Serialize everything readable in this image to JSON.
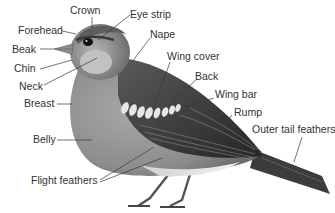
{
  "diagram": {
    "labels": [
      {
        "id": "crown",
        "text": "Crown"
      },
      {
        "id": "eye-strip",
        "text": "Eye strip"
      },
      {
        "id": "forehead",
        "text": "Forehead"
      },
      {
        "id": "nape",
        "text": "Nape"
      },
      {
        "id": "beak",
        "text": "Beak"
      },
      {
        "id": "chin",
        "text": "Chin"
      },
      {
        "id": "wing-cover",
        "text": "Wing cover"
      },
      {
        "id": "neck",
        "text": "Neck"
      },
      {
        "id": "back",
        "text": "Back"
      },
      {
        "id": "breast",
        "text": "Breast"
      },
      {
        "id": "wing-bar",
        "text": "Wing bar"
      },
      {
        "id": "rump",
        "text": "Rump"
      },
      {
        "id": "outer-tail-feathers",
        "text": "Outer tail feathers"
      },
      {
        "id": "belly",
        "text": "Belly"
      },
      {
        "id": "flight-feathers",
        "text": "Flight feathers"
      }
    ],
    "colors": {
      "background": "#ffffff",
      "label_text": "#333333",
      "leader_line": "#3a3a3a",
      "body_light": "#9a9a9a",
      "body_dark": "#4a4a4a",
      "wing_dark": "#2e2e2e",
      "wing_bar": "#e8e8e8"
    }
  }
}
